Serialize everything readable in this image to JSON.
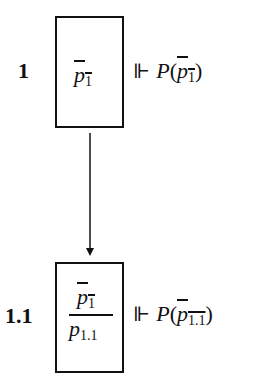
{
  "nodes": [
    {
      "label": "1",
      "box_lines": [
        {
          "base": "p",
          "sub": "1",
          "negated": true
        }
      ],
      "forces_symbol": "⊩",
      "predicate": "P",
      "argument": {
        "base": "p",
        "sub": "1",
        "negated": true
      }
    },
    {
      "label": "1.1",
      "box_lines": [
        {
          "base": "p",
          "sub": "1",
          "negated": true
        },
        {
          "base": "p",
          "sub": "1.1",
          "negated": false
        }
      ],
      "forces_symbol": "⊩",
      "predicate": "P",
      "argument": {
        "base": "p",
        "sub": "1.1",
        "negated": true
      }
    }
  ],
  "edges": [
    {
      "from": "1",
      "to": "1.1"
    }
  ]
}
